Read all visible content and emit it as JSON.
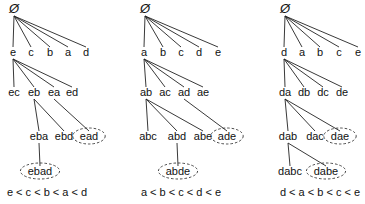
{
  "diagram": {
    "root_symbol": "Ø",
    "trees": [
      {
        "name": "tree-e-first",
        "caption": "e < c < b < a < d",
        "caption_pos": [
          47,
          196
        ],
        "nodes": [
          {
            "id": "root",
            "label": "Ø",
            "x": 14,
            "y": 13,
            "root": true
          },
          {
            "id": "e",
            "label": "e",
            "x": 13,
            "y": 56
          },
          {
            "id": "c",
            "label": "c",
            "x": 31,
            "y": 56
          },
          {
            "id": "b",
            "label": "b",
            "x": 50,
            "y": 56
          },
          {
            "id": "a",
            "label": "a",
            "x": 68,
            "y": 56
          },
          {
            "id": "d",
            "label": "d",
            "x": 86,
            "y": 56
          },
          {
            "id": "ec",
            "label": "ec",
            "x": 14,
            "y": 96
          },
          {
            "id": "eb",
            "label": "eb",
            "x": 34,
            "y": 96
          },
          {
            "id": "ea",
            "label": "ea",
            "x": 54,
            "y": 96
          },
          {
            "id": "ed",
            "label": "ed",
            "x": 72,
            "y": 96
          },
          {
            "id": "eba",
            "label": "eba",
            "x": 39,
            "y": 140
          },
          {
            "id": "ebd",
            "label": "ebd",
            "x": 64,
            "y": 140
          },
          {
            "id": "ead",
            "label": "ead",
            "x": 89,
            "y": 140,
            "circled": true
          },
          {
            "id": "ebad",
            "label": "ebad",
            "x": 40,
            "y": 175,
            "circled": true
          }
        ],
        "edges": [
          [
            "root",
            "e"
          ],
          [
            "root",
            "c"
          ],
          [
            "root",
            "b"
          ],
          [
            "root",
            "a"
          ],
          [
            "root",
            "d"
          ],
          [
            "e",
            "ec"
          ],
          [
            "e",
            "eb"
          ],
          [
            "e",
            "ea"
          ],
          [
            "e",
            "ed"
          ],
          [
            "eb",
            "eba"
          ],
          [
            "eb",
            "ebd"
          ],
          [
            "ea",
            "ead"
          ],
          [
            "eba",
            "ebad"
          ]
        ]
      },
      {
        "name": "tree-a-first",
        "caption": "a < b < c < d < e",
        "caption_pos": [
          181,
          196
        ],
        "nodes": [
          {
            "id": "root",
            "label": "Ø",
            "x": 145,
            "y": 13,
            "root": true
          },
          {
            "id": "a",
            "label": "a",
            "x": 144,
            "y": 56
          },
          {
            "id": "b",
            "label": "b",
            "x": 163,
            "y": 56
          },
          {
            "id": "c",
            "label": "c",
            "x": 181,
            "y": 56
          },
          {
            "id": "d",
            "label": "d",
            "x": 199,
            "y": 56
          },
          {
            "id": "e",
            "label": "e",
            "x": 218,
            "y": 56
          },
          {
            "id": "ab",
            "label": "ab",
            "x": 146,
            "y": 96
          },
          {
            "id": "ac",
            "label": "ac",
            "x": 165,
            "y": 96
          },
          {
            "id": "ad",
            "label": "ad",
            "x": 184,
            "y": 96
          },
          {
            "id": "ae",
            "label": "ae",
            "x": 203,
            "y": 96
          },
          {
            "id": "abc",
            "label": "abc",
            "x": 148,
            "y": 140
          },
          {
            "id": "abd",
            "label": "abd",
            "x": 177,
            "y": 140
          },
          {
            "id": "abe",
            "label": "abe",
            "x": 203,
            "y": 140
          },
          {
            "id": "ade",
            "label": "ade",
            "x": 227,
            "y": 140,
            "circled": true
          },
          {
            "id": "abde",
            "label": "abde",
            "x": 178,
            "y": 175,
            "circled": true
          }
        ],
        "edges": [
          [
            "root",
            "a"
          ],
          [
            "root",
            "b"
          ],
          [
            "root",
            "c"
          ],
          [
            "root",
            "d"
          ],
          [
            "root",
            "e"
          ],
          [
            "a",
            "ab"
          ],
          [
            "a",
            "ac"
          ],
          [
            "a",
            "ad"
          ],
          [
            "a",
            "ae"
          ],
          [
            "ab",
            "abc"
          ],
          [
            "ab",
            "abd"
          ],
          [
            "ab",
            "abe"
          ],
          [
            "ad",
            "ade"
          ],
          [
            "abd",
            "abde"
          ]
        ]
      },
      {
        "name": "tree-d-first",
        "caption": "d < a < b < c < e",
        "caption_pos": [
          320,
          196
        ],
        "nodes": [
          {
            "id": "root",
            "label": "Ø",
            "x": 285,
            "y": 13,
            "root": true
          },
          {
            "id": "d",
            "label": "d",
            "x": 284,
            "y": 56
          },
          {
            "id": "a",
            "label": "a",
            "x": 302,
            "y": 56
          },
          {
            "id": "b",
            "label": "b",
            "x": 320,
            "y": 56
          },
          {
            "id": "c",
            "label": "c",
            "x": 339,
            "y": 56
          },
          {
            "id": "e",
            "label": "e",
            "x": 358,
            "y": 56
          },
          {
            "id": "da",
            "label": "da",
            "x": 285,
            "y": 96
          },
          {
            "id": "db",
            "label": "db",
            "x": 304,
            "y": 96
          },
          {
            "id": "dc",
            "label": "dc",
            "x": 323,
            "y": 96
          },
          {
            "id": "de",
            "label": "de",
            "x": 342,
            "y": 96
          },
          {
            "id": "dab",
            "label": "dab",
            "x": 288,
            "y": 140
          },
          {
            "id": "dac",
            "label": "dac",
            "x": 315,
            "y": 140
          },
          {
            "id": "dae",
            "label": "dae",
            "x": 340,
            "y": 140,
            "circled": true
          },
          {
            "id": "dabc",
            "label": "dabc",
            "x": 290,
            "y": 175
          },
          {
            "id": "dabe",
            "label": "dabe",
            "x": 326,
            "y": 175,
            "circled": true
          }
        ],
        "edges": [
          [
            "root",
            "d"
          ],
          [
            "root",
            "a"
          ],
          [
            "root",
            "b"
          ],
          [
            "root",
            "c"
          ],
          [
            "root",
            "e"
          ],
          [
            "d",
            "da"
          ],
          [
            "d",
            "db"
          ],
          [
            "d",
            "dc"
          ],
          [
            "d",
            "de"
          ],
          [
            "da",
            "dab"
          ],
          [
            "da",
            "dac"
          ],
          [
            "da",
            "dae"
          ],
          [
            "dab",
            "dabc"
          ],
          [
            "dab",
            "dabe"
          ]
        ]
      }
    ]
  }
}
